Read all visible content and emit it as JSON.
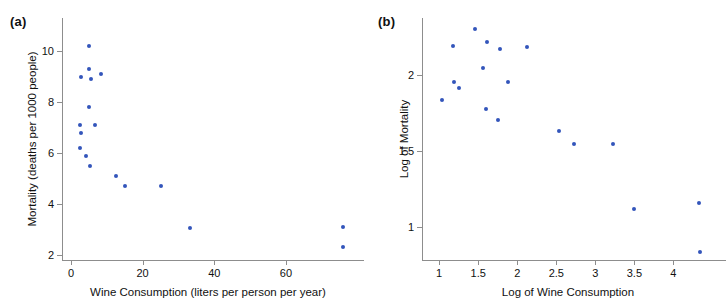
{
  "figure": {
    "panel_a_label": "(a)",
    "panel_b_label": "(b)"
  },
  "chart_data": [
    {
      "type": "scatter",
      "panel": "(a)",
      "title": "",
      "xlabel": "Wine Consumption (liters per person per year)",
      "ylabel": "Mortality (deaths per 1000 people)",
      "xticks": [
        0,
        20,
        40,
        60
      ],
      "xticklabels": [
        "0",
        "20",
        "40",
        "60"
      ],
      "yticks": [
        2,
        4,
        6,
        8,
        10
      ],
      "yticklabels": [
        "2",
        "4",
        "6",
        "8",
        "10"
      ],
      "xlim": [
        -2.5,
        79
      ],
      "ylim": [
        1.8,
        11.3
      ],
      "grid": false,
      "legend": null,
      "marker_color": "#3355bb",
      "points": [
        {
          "x": 2.8,
          "y": 9.0
        },
        {
          "x": 2.5,
          "y": 7.1
        },
        {
          "x": 2.7,
          "y": 6.8
        },
        {
          "x": 2.4,
          "y": 6.2
        },
        {
          "x": 4.9,
          "y": 10.2
        },
        {
          "x": 5.1,
          "y": 9.3
        },
        {
          "x": 5.7,
          "y": 8.9
        },
        {
          "x": 5.0,
          "y": 7.8
        },
        {
          "x": 4.3,
          "y": 5.9
        },
        {
          "x": 5.2,
          "y": 5.5
        },
        {
          "x": 6.6,
          "y": 7.1
        },
        {
          "x": 8.3,
          "y": 9.1
        },
        {
          "x": 12.6,
          "y": 5.1
        },
        {
          "x": 15.1,
          "y": 4.7
        },
        {
          "x": 25.1,
          "y": 4.7
        },
        {
          "x": 33.1,
          "y": 3.05
        },
        {
          "x": 75.9,
          "y": 3.1
        },
        {
          "x": 75.9,
          "y": 2.3
        }
      ]
    },
    {
      "type": "scatter",
      "panel": "(b)",
      "title": "",
      "xlabel": "Log of Wine Consumption",
      "ylabel": "Log of Mortality",
      "xticks": [
        1,
        1.5,
        2,
        2.5,
        3,
        3.5,
        4
      ],
      "xticklabels": [
        "1",
        "1.5",
        "2",
        "2.5",
        "3",
        "3.5",
        "4"
      ],
      "yticks": [
        1,
        1.5,
        2
      ],
      "yticklabels": [
        "1",
        "1.5",
        "2"
      ],
      "xlim": [
        0.78,
        4.52
      ],
      "ylim": [
        0.78,
        2.38
      ],
      "grid": false,
      "legend": null,
      "marker_color": "#3355bb",
      "points": [
        {
          "x": 1.03,
          "y": 1.835
        },
        {
          "x": 1.18,
          "y": 2.195
        },
        {
          "x": 1.19,
          "y": 1.96
        },
        {
          "x": 1.25,
          "y": 1.915
        },
        {
          "x": 1.465,
          "y": 2.305
        },
        {
          "x": 1.555,
          "y": 2.05
        },
        {
          "x": 1.61,
          "y": 2.22
        },
        {
          "x": 1.605,
          "y": 1.78
        },
        {
          "x": 1.755,
          "y": 1.705
        },
        {
          "x": 1.78,
          "y": 2.175
        },
        {
          "x": 1.885,
          "y": 1.96
        },
        {
          "x": 2.13,
          "y": 2.19
        },
        {
          "x": 2.535,
          "y": 1.63
        },
        {
          "x": 2.73,
          "y": 1.545
        },
        {
          "x": 3.225,
          "y": 1.545
        },
        {
          "x": 3.495,
          "y": 1.12
        },
        {
          "x": 4.33,
          "y": 1.155
        },
        {
          "x": 4.34,
          "y": 0.835
        }
      ]
    }
  ]
}
